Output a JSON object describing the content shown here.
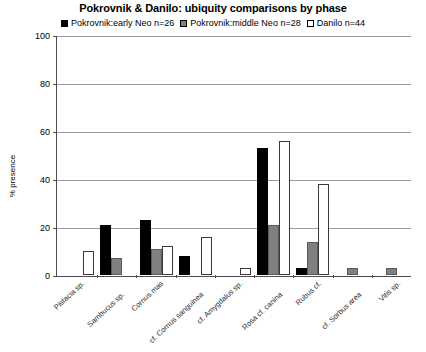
{
  "chart_data": {
    "type": "bar",
    "title": "Pokrovnik & Danilo: ubiquity comparisons by phase",
    "xlabel": "",
    "ylabel": "% presence",
    "ylim": [
      0,
      100
    ],
    "yticks": [
      0,
      20,
      40,
      60,
      80,
      100
    ],
    "grid": true,
    "legend_position": "top-center",
    "categories": [
      "Pistacia sp.",
      "Sambucus sp.",
      "Cornus mas",
      "cf. Cornus sanguinea",
      "cf. Amygdalus sp.",
      "Rosa cf. canina",
      "Rubus cf.",
      "cf. Sorbus area",
      "Vitis sp."
    ],
    "series": [
      {
        "name": "Pokrovnik:early Neo n=26",
        "color": "#000000",
        "swatch": "sw-black",
        "values": [
          0,
          21,
          23,
          8,
          0,
          53,
          3,
          0,
          0
        ]
      },
      {
        "name": "Pokrovnik:middle Neo n=28",
        "color": "#808080",
        "swatch": "sw-gray",
        "values": [
          0,
          7,
          11,
          0,
          0,
          21,
          14,
          3,
          3
        ]
      },
      {
        "name": "Danilo n=44",
        "color": "#ffffff",
        "swatch": "sw-white",
        "values": [
          10,
          0,
          12,
          16,
          3,
          56,
          38,
          0,
          0
        ]
      }
    ]
  },
  "legend": {
    "items": [
      {
        "label": "Pokrovnik:early Neo n=26",
        "swatch": "sw-black"
      },
      {
        "label": "Pokrovnik:middle Neo n=28",
        "swatch": "sw-gray"
      },
      {
        "label": "Danilo n=44",
        "swatch": "sw-white"
      }
    ]
  },
  "axis": {
    "y_title": "% presence",
    "y_labels": [
      "100",
      "80",
      "60",
      "40",
      "20",
      "0"
    ]
  }
}
